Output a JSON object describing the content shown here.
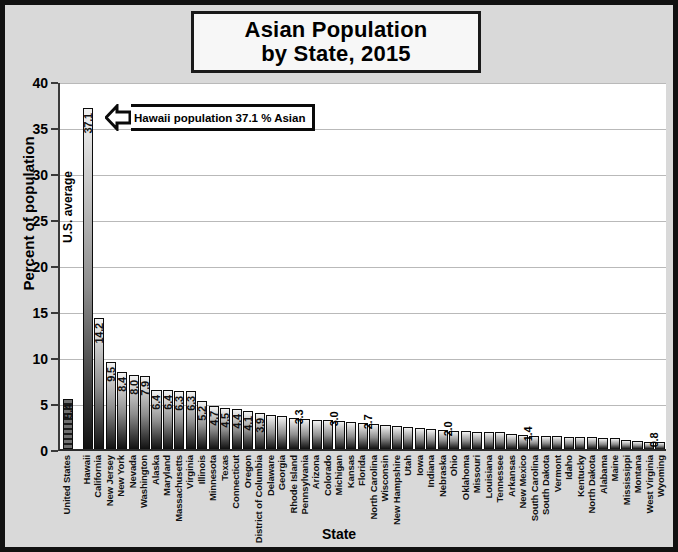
{
  "title": {
    "line1": "Asian Population",
    "line2": "by State, 2015"
  },
  "annotations": {
    "callout_text": "Hawaii population 37.1 % Asian",
    "us_average_text": "U.S. average"
  },
  "chart_data": {
    "type": "bar",
    "title": "Asian Population by State, 2015",
    "xlabel": "State",
    "ylabel": "Percent of population",
    "ylim": [
      0,
      40
    ],
    "yticks": [
      0,
      5,
      10,
      15,
      20,
      25,
      30,
      35,
      40
    ],
    "grid": true,
    "legend": null,
    "categories": [
      "United States",
      "Hawaii",
      "California",
      "New Jersey",
      "New York",
      "Nevada",
      "Washington",
      "Alaska",
      "Maryland",
      "Massachusetts",
      "Virginia",
      "Illinois",
      "Minnesota",
      "Texas",
      "Connecticut",
      "Oregon",
      "District of Columbia",
      "Delaware",
      "Georgia",
      "Rhode Island",
      "Pennsylvania",
      "Arizona",
      "Colorado",
      "Michigan",
      "Kansas",
      "Florida",
      "North Carolina",
      "Wisconsin",
      "New Hampshire",
      "Utah",
      "Iowa",
      "Indiana",
      "Nebraska",
      "Ohio",
      "Oklahoma",
      "Missouri",
      "Louisiana",
      "Tennessee",
      "Arkansas",
      "New Mexico",
      "South Carolina",
      "South Dakota",
      "Vermont",
      "Idaho",
      "Kentucky",
      "North Dakota",
      "Alabama",
      "Maine",
      "Mississippi",
      "Montana",
      "West Virginia",
      "Wyoming"
    ],
    "values": [
      5.4,
      37.1,
      14.2,
      9.5,
      8.4,
      8.0,
      7.9,
      6.4,
      6.4,
      6.3,
      6.3,
      5.2,
      4.7,
      4.5,
      4.4,
      4.1,
      3.9,
      3.7,
      3.6,
      3.4,
      3.3,
      3.2,
      3.1,
      3.0,
      2.9,
      2.8,
      2.7,
      2.6,
      2.5,
      2.4,
      2.3,
      2.2,
      2.1,
      2.0,
      2.0,
      1.9,
      1.8,
      1.8,
      1.6,
      1.5,
      1.4,
      1.4,
      1.4,
      1.3,
      1.3,
      1.3,
      1.2,
      1.2,
      1.0,
      0.9,
      0.8,
      0.8
    ],
    "value_labels": {
      "0": "5.4",
      "1": "37.1",
      "2": "14.2",
      "3": "9.5",
      "4": "8.4",
      "5": "8.0",
      "6": "7.9",
      "7": "6.4",
      "8": "6.4",
      "9": "6.3",
      "10": "6.3",
      "11": "5.2",
      "12": "4.7",
      "13": "4.5",
      "14": "4.4",
      "15": "4.1",
      "16": "3.9",
      "20": "3.3",
      "23": "3.0",
      "26": "2.7",
      "33": "2.0",
      "40": "1.4",
      "51": "0.8"
    }
  }
}
